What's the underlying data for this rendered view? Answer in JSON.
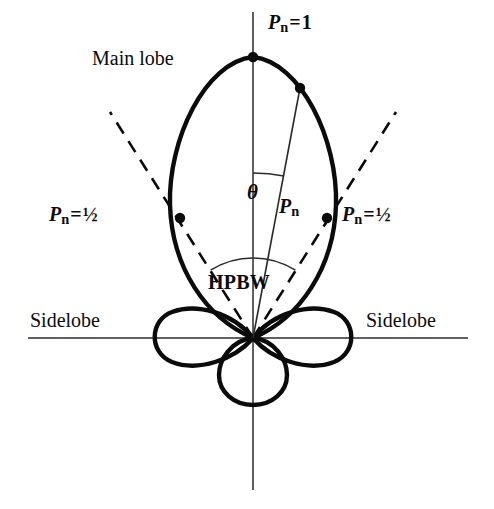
{
  "figure": {
    "kind": "antenna-radiation-pattern-polar-diagram",
    "width": 494,
    "height": 509,
    "background_color": "#ffffff",
    "ink_color": "#0b0b0b"
  },
  "labels": {
    "main_lobe": "Main lobe",
    "sidelobe_left": "Sidelobe",
    "sidelobe_right": "Sidelobe",
    "hpbw": "HPBW",
    "pn_symbol": "P",
    "pn_subscript": "n",
    "equals": "=",
    "value_max": "1",
    "value_half": "½",
    "theta": "θ"
  },
  "annotations": {
    "peak": {
      "text": "P n = 1",
      "value": "1",
      "at_x": 253,
      "at_y": 57
    },
    "half_power_left": {
      "text": "P n = ½",
      "value": "½",
      "at_x": 180,
      "at_y": 218
    },
    "half_power_right": {
      "text": "P n = ½",
      "value": "½",
      "at_x": 327,
      "at_y": 218
    },
    "radius_label": {
      "text": "P n",
      "at_x": 300,
      "at_y": 88
    },
    "angle_label": {
      "text": "θ",
      "at_x": 253,
      "at_y": 180
    },
    "beamwidth_label": {
      "text": "HPBW",
      "arc_radius": 80
    }
  },
  "chart_data": {
    "type": "line",
    "title": "",
    "subtitle": "",
    "xlabel": "",
    "ylabel": "",
    "coordinate_system": "polar",
    "origin": {
      "x": 253,
      "y": 338
    },
    "axes": {
      "vertical": {
        "x": 253,
        "y_top": 12,
        "y_bottom": 490,
        "stroke": "#2b2b2b",
        "stroke_width": 1.4
      },
      "horizontal": {
        "y": 338,
        "x_left": 28,
        "x_right": 468,
        "stroke": "#2b2b2b",
        "stroke_width": 1.4
      },
      "grid": false,
      "legend": "none"
    },
    "normalized_power_levels": {
      "main_lobe_peak": 1,
      "half_power": 0.5,
      "sidelobe_peak": 0.22,
      "back_lobe_peak": 0.14
    },
    "lobes": [
      {
        "name": "main-lobe",
        "direction_deg": 90,
        "peak_normalized_power": 1,
        "peak_point": {
          "x": 253,
          "y": 57
        },
        "half_width_px": 84,
        "length_px": 281,
        "stroke_width": 4.2
      },
      {
        "name": "sidelobe-left",
        "direction_deg": 180,
        "peak_normalized_power": 0.22,
        "tip_point": {
          "x": 148,
          "y": 338
        },
        "length_px": 105,
        "half_width_px": 24,
        "stroke_width": 4.2
      },
      {
        "name": "sidelobe-right",
        "direction_deg": 0,
        "peak_normalized_power": 0.22,
        "tip_point": {
          "x": 358,
          "y": 338
        },
        "length_px": 105,
        "half_width_px": 24,
        "stroke_width": 4.2
      },
      {
        "name": "back-lobe",
        "direction_deg": 270,
        "peak_normalized_power": 0.14,
        "tip_point": {
          "x": 253,
          "y": 404
        },
        "radius_px": 33,
        "stroke_width": 4.2
      }
    ],
    "markers": [
      {
        "name": "peak-marker",
        "x": 253,
        "y": 57,
        "r": 5.2,
        "normalized_power": 1
      },
      {
        "name": "radius-marker",
        "x": 300,
        "y": 88,
        "r": 5.2,
        "normalized_power": 1
      },
      {
        "name": "half-power-marker-left",
        "x": 180,
        "y": 218,
        "r": 5.2,
        "normalized_power": 0.5
      },
      {
        "name": "half-power-marker-right",
        "x": 327,
        "y": 218,
        "r": 5.2,
        "normalized_power": 0.5
      }
    ],
    "half_power_rays": [
      {
        "name": "hpbw-ray-left",
        "from_x": 253,
        "from_y": 338,
        "to_x": 110,
        "to_y": 112,
        "dashed": true
      },
      {
        "name": "hpbw-ray-right",
        "from_x": 253,
        "from_y": 338,
        "to_x": 396,
        "to_y": 112,
        "dashed": true
      }
    ],
    "radius_ray": {
      "name": "pn-radius-ray",
      "from_x": 253,
      "from_y": 338,
      "to_x": 300,
      "to_y": 88,
      "dashed": false
    },
    "angle_arc": {
      "name": "theta-arc",
      "center_x": 253,
      "center_y": 338,
      "radius": 165,
      "from_deg": 90,
      "to_deg": 79
    },
    "beamwidth_arc": {
      "name": "hpbw-arc",
      "center_x": 253,
      "center_y": 338,
      "radius": 80,
      "from_deg": 122,
      "to_deg": 58
    }
  }
}
